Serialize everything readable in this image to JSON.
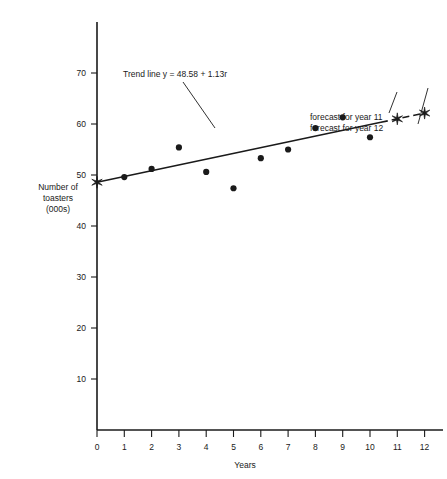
{
  "chart_data": {
    "type": "scatter",
    "title": "",
    "xlabel": "Years",
    "ylabel": "Number of toasters (000s)",
    "ylabel_lines": [
      "Number of",
      "toasters",
      "(000s)"
    ],
    "xlim": [
      0,
      12.6
    ],
    "ylim": [
      0,
      73
    ],
    "grid": false,
    "legend": "none",
    "x_ticks": [
      0,
      1,
      2,
      3,
      4,
      5,
      6,
      7,
      8,
      9,
      10,
      11,
      12
    ],
    "x_tick_labels": [
      "0",
      "1",
      "2",
      "3",
      "4",
      "5",
      "6",
      "7",
      "8",
      "9",
      "10",
      "11",
      "12"
    ],
    "y_ticks": [
      10,
      20,
      30,
      40,
      50,
      60,
      70
    ],
    "y_tick_labels": [
      "10",
      "20",
      "30",
      "40",
      "50",
      "60",
      "70"
    ],
    "series": [
      {
        "name": "observed",
        "marker": "filled-circle",
        "x": [
          1,
          2,
          3,
          4,
          5,
          6,
          7,
          8,
          9,
          10
        ],
        "values": [
          49.6,
          51.2,
          55.4,
          50.6,
          47.4,
          53.3,
          55.0,
          59.2,
          61.3,
          57.4
        ]
      },
      {
        "name": "forecast",
        "marker": "star",
        "x": [
          0,
          11,
          12
        ],
        "values": [
          48.58,
          61.01,
          62.14
        ]
      }
    ],
    "trend_line": {
      "label": "Trend line y = 48.58 + 1.13r",
      "intercept": 48.58,
      "slope": 1.13,
      "x_start": 0,
      "x_end": 10.4,
      "style": "solid"
    },
    "forecast_segment": {
      "x_start": 10.4,
      "x_end": 12,
      "style": "dashed"
    },
    "annotations": [
      {
        "id": "trend-label",
        "text": "Trend line y = 48.58 + 1.13r",
        "text_x": 123,
        "text_y": 77,
        "leader_from_x": 183,
        "leader_from_y": 82,
        "leader_to_x": 215,
        "leader_to_y": 128
      },
      {
        "id": "forecast-11",
        "text": "forecast for year 11",
        "text_x": 310,
        "text_y": 120,
        "leader_from_x": 389,
        "leader_from_y": 113,
        "leader_to_x": 397,
        "leader_to_y": 92
      },
      {
        "id": "forecast-12",
        "text": "forecast for year 12",
        "text_x": 310,
        "text_y": 131,
        "leader_from_x": 418,
        "leader_from_y": 124,
        "leader_to_x": 428,
        "leader_to_y": 88
      }
    ]
  },
  "axes": {
    "x_axis_name": "Years",
    "y_axis_name": "Number of toasters (000s)"
  }
}
